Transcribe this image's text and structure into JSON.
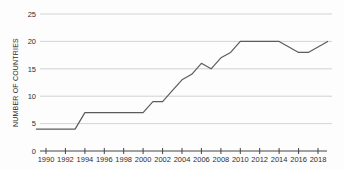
{
  "chart_data": {
    "type": "line",
    "title": "",
    "xlabel": "",
    "ylabel": "NUMBER OF COUNTRIES",
    "x": [
      1989,
      1990,
      1991,
      1992,
      1993,
      1994,
      1995,
      1996,
      1997,
      1998,
      1999,
      2000,
      2001,
      2002,
      2003,
      2004,
      2005,
      2006,
      2007,
      2008,
      2009,
      2010,
      2011,
      2012,
      2013,
      2014,
      2015,
      2016,
      2017,
      2018,
      2019
    ],
    "values": [
      4,
      4,
      4,
      4,
      4,
      7,
      7,
      7,
      7,
      7,
      7,
      7,
      9,
      9,
      11,
      13,
      14,
      16,
      15,
      17,
      18,
      20,
      20,
      20,
      20,
      20,
      19,
      18,
      18,
      19,
      20
    ],
    "ylim": [
      0,
      25
    ],
    "yticks": [
      0,
      5,
      10,
      15,
      20,
      25
    ],
    "xticks": [
      1990,
      1992,
      1994,
      1996,
      1998,
      2000,
      2002,
      2004,
      2006,
      2008,
      2010,
      2012,
      2014,
      2016,
      2018
    ],
    "grid": "horizontal",
    "legend": "none",
    "colors": {
      "line": "#5c5c5c",
      "grid": "#c8c8c8",
      "axis": "#444444",
      "text": "#2e2e2e",
      "background": "#fdfdfd"
    }
  }
}
